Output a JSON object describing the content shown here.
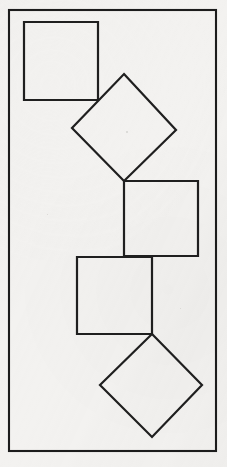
{
  "figure": {
    "canvas": {
      "width": 227,
      "height": 467
    },
    "colors": {
      "background": "#f3f2f0",
      "stroke": "#1f1f1f",
      "frame_stroke": "#1c1c1c",
      "shape_fill": "none"
    },
    "frame": {
      "name": "outer-border",
      "x": 9,
      "y": 10,
      "width": 207,
      "height": 441,
      "stroke_width": 2.1
    },
    "shapes": [
      {
        "id": "shape-1",
        "kind": "square",
        "label": "upper-left square",
        "orientation": "axis-aligned",
        "points": "24,22 98,22 98,100 24,100",
        "bbox": {
          "x": 24,
          "y": 22,
          "width": 74,
          "height": 78
        }
      },
      {
        "id": "shape-2",
        "kind": "diamond",
        "label": "upper diamond",
        "orientation": "rotated-45",
        "points": "124,74 176,130 124,181 72,128",
        "bbox": {
          "x": 72,
          "y": 74,
          "width": 104,
          "height": 107
        }
      },
      {
        "id": "shape-3",
        "kind": "square",
        "label": "middle-right square",
        "orientation": "axis-aligned",
        "points": "124,181 198,181 198,256 124,256",
        "bbox": {
          "x": 124,
          "y": 181,
          "width": 74,
          "height": 75
        }
      },
      {
        "id": "shape-4",
        "kind": "square",
        "label": "lower-left square",
        "orientation": "axis-aligned",
        "points": "77,257 152,257 152,334 77,334",
        "bbox": {
          "x": 77,
          "y": 257,
          "width": 75,
          "height": 77
        }
      },
      {
        "id": "shape-5",
        "kind": "diamond",
        "label": "lower diamond",
        "orientation": "rotated-45",
        "points": "152,334 202,385 152,437 100,385",
        "bbox": {
          "x": 100,
          "y": 334,
          "width": 102,
          "height": 103
        }
      }
    ],
    "contact_points": [
      {
        "id": "contact-1",
        "between": "shape-1 and shape-2",
        "x": 98,
        "y": 100
      },
      {
        "id": "contact-2",
        "between": "shape-2 and shape-3",
        "x": 124,
        "y": 181
      },
      {
        "id": "contact-3",
        "between": "shape-3 and shape-4",
        "x": 152,
        "y": 257
      },
      {
        "id": "contact-4",
        "between": "shape-4 and shape-5",
        "x": 152,
        "y": 334
      }
    ],
    "specks": [
      {
        "x": 126,
        "y": 131,
        "size": 2
      },
      {
        "x": 47,
        "y": 214,
        "size": 1
      },
      {
        "x": 180,
        "y": 308,
        "size": 1
      }
    ]
  }
}
